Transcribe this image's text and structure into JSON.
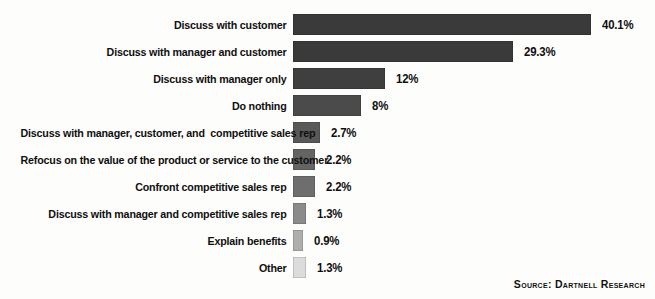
{
  "chart_data": {
    "type": "bar",
    "orientation": "horizontal",
    "title": "",
    "xlabel": "",
    "ylabel": "",
    "grid": false,
    "legend": null,
    "xlim": [
      0,
      40.1
    ],
    "categories": [
      "Discuss with customer",
      "Discuss with manager and customer",
      "Discuss with manager only",
      "Do nothing",
      "Discuss with manager, customer, and  competitive sales rep",
      "Refocus on the value of the product or service to the customer",
      "Confront competitive sales rep",
      "Discuss with manager and competitive sales rep",
      "Explain benefits",
      "Other"
    ],
    "values": [
      40.1,
      29.3,
      12,
      8,
      2.7,
      2.2,
      2.2,
      1.3,
      0.9,
      1.3
    ],
    "value_labels": [
      "40.1%",
      "29.3%",
      "12%",
      "8%",
      "2.7%",
      "2.2%",
      "2.2%",
      "1.3%",
      "0.9%",
      "1.3%"
    ],
    "bar_colors": [
      "#3a3a3a",
      "#3a3a3a",
      "#3f3f3f",
      "#4b4b4b",
      "#585858",
      "#646464",
      "#6e6e6e",
      "#8b8b8b",
      "#aeaeae",
      "#dcdcdc"
    ],
    "bar_pixel_widths": [
      298,
      220,
      92,
      68,
      27,
      22,
      22,
      13,
      10,
      13
    ],
    "annotations": [
      "Source: Dartnell Research"
    ]
  },
  "source": {
    "text": "Source: Dartnell Research"
  }
}
